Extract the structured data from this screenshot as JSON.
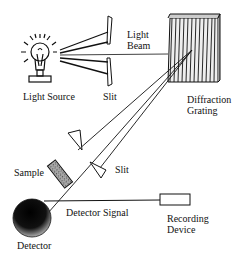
{
  "diagram": {
    "type": "spectrophotometer-schematic",
    "labels": {
      "light_source": "Light Source",
      "slit_top": "Slit",
      "light_beam_line1": "Light",
      "light_beam_line2": "Beam",
      "diffraction_line1": "Diffraction",
      "diffraction_line2": "Grating",
      "sample": "Sample",
      "slit_bottom": "Slit",
      "detector_signal": "Detector Signal",
      "recording_line1": "Recording",
      "recording_line2": "Device",
      "detector": "Detector"
    },
    "components": [
      {
        "id": "light-source",
        "icon": "light-bulb-icon"
      },
      {
        "id": "entrance-slit",
        "icon": "slit-icon"
      },
      {
        "id": "diffraction-grating",
        "icon": "grating-icon"
      },
      {
        "id": "exit-slit",
        "icon": "slit-icon"
      },
      {
        "id": "sample",
        "icon": "sample-cuvette-icon"
      },
      {
        "id": "detector",
        "icon": "detector-sphere-icon"
      },
      {
        "id": "recording-device",
        "icon": "recorder-box-icon"
      }
    ],
    "colors": {
      "ink": "#111111",
      "background": "#ffffff",
      "sample_fill": "#9a9a9a"
    }
  }
}
